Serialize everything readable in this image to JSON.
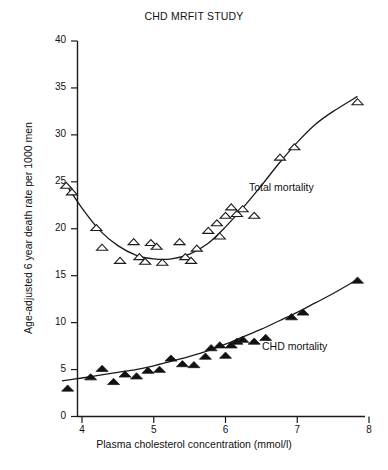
{
  "chart_data": {
    "type": "scatter",
    "title": "CHD MRFIT STUDY",
    "xlabel": "Plasma cholesterol concentration (mmol/l)",
    "ylabel": "Age-adjusted 6 year death rate per 1000 men",
    "xlim": [
      3.7,
      8.0
    ],
    "ylim": [
      0,
      40
    ],
    "xticks": [
      4,
      5,
      6,
      7,
      8
    ],
    "yticks": [
      0,
      5,
      10,
      15,
      20,
      25,
      30,
      35,
      40
    ],
    "grid": false,
    "legend_position": "inline-annotations",
    "series": [
      {
        "name": "Total mortality",
        "marker": "open-triangle",
        "label_text": "Total mortality",
        "points": [
          [
            3.78,
            24.6
          ],
          [
            3.86,
            23.9
          ],
          [
            4.2,
            20.1
          ],
          [
            4.28,
            18.0
          ],
          [
            4.53,
            16.6
          ],
          [
            4.72,
            18.6
          ],
          [
            4.8,
            17.0
          ],
          [
            4.88,
            16.5
          ],
          [
            4.96,
            18.5
          ],
          [
            5.04,
            18.1
          ],
          [
            5.12,
            16.4
          ],
          [
            5.36,
            18.6
          ],
          [
            5.44,
            17.0
          ],
          [
            5.52,
            16.6
          ],
          [
            5.6,
            17.9
          ],
          [
            5.76,
            19.8
          ],
          [
            5.88,
            20.6
          ],
          [
            5.92,
            19.2
          ],
          [
            6.0,
            21.4
          ],
          [
            6.08,
            22.3
          ],
          [
            6.16,
            21.6
          ],
          [
            6.24,
            22.1
          ],
          [
            6.4,
            21.4
          ],
          [
            6.76,
            27.6
          ],
          [
            6.96,
            28.7
          ],
          [
            7.84,
            33.5
          ]
        ]
      },
      {
        "name": "CHD mortality",
        "marker": "filled-triangle",
        "label_text": "CHD mortality",
        "points": [
          [
            3.8,
            3.0
          ],
          [
            4.12,
            4.2
          ],
          [
            4.28,
            5.1
          ],
          [
            4.44,
            3.7
          ],
          [
            4.6,
            4.5
          ],
          [
            4.76,
            4.3
          ],
          [
            4.92,
            4.9
          ],
          [
            5.08,
            5.0
          ],
          [
            5.24,
            6.2
          ],
          [
            5.4,
            5.6
          ],
          [
            5.56,
            5.5
          ],
          [
            5.72,
            6.4
          ],
          [
            5.8,
            7.3
          ],
          [
            5.92,
            7.6
          ],
          [
            6.0,
            6.5
          ],
          [
            6.08,
            7.6
          ],
          [
            6.16,
            8.0
          ],
          [
            6.24,
            8.2
          ],
          [
            6.4,
            8.0
          ],
          [
            6.56,
            8.4
          ],
          [
            6.92,
            10.6
          ],
          [
            7.08,
            11.1
          ],
          [
            7.84,
            14.5
          ]
        ]
      }
    ],
    "fit_curves": [
      {
        "name": "Total mortality fit",
        "points": [
          [
            3.78,
            24.7
          ],
          [
            4.0,
            22.2
          ],
          [
            4.25,
            19.8
          ],
          [
            4.5,
            18.2
          ],
          [
            4.75,
            17.2
          ],
          [
            5.0,
            16.8
          ],
          [
            5.25,
            16.8
          ],
          [
            5.5,
            17.3
          ],
          [
            5.75,
            18.4
          ],
          [
            6.0,
            20.2
          ],
          [
            6.25,
            22.3
          ],
          [
            6.5,
            24.6
          ],
          [
            6.75,
            27.0
          ],
          [
            7.0,
            29.2
          ],
          [
            7.25,
            31.1
          ],
          [
            7.5,
            32.5
          ],
          [
            7.84,
            34.1
          ]
        ]
      },
      {
        "name": "CHD mortality fit",
        "points": [
          [
            3.72,
            3.8
          ],
          [
            4.0,
            4.1
          ],
          [
            4.25,
            4.4
          ],
          [
            4.5,
            4.7
          ],
          [
            4.75,
            5.0
          ],
          [
            5.0,
            5.4
          ],
          [
            5.25,
            5.9
          ],
          [
            5.5,
            6.4
          ],
          [
            5.75,
            7.0
          ],
          [
            6.0,
            7.7
          ],
          [
            6.25,
            8.5
          ],
          [
            6.5,
            9.3
          ],
          [
            6.75,
            10.2
          ],
          [
            7.0,
            11.1
          ],
          [
            7.25,
            12.1
          ],
          [
            7.5,
            13.1
          ],
          [
            7.84,
            14.6
          ]
        ]
      }
    ]
  }
}
